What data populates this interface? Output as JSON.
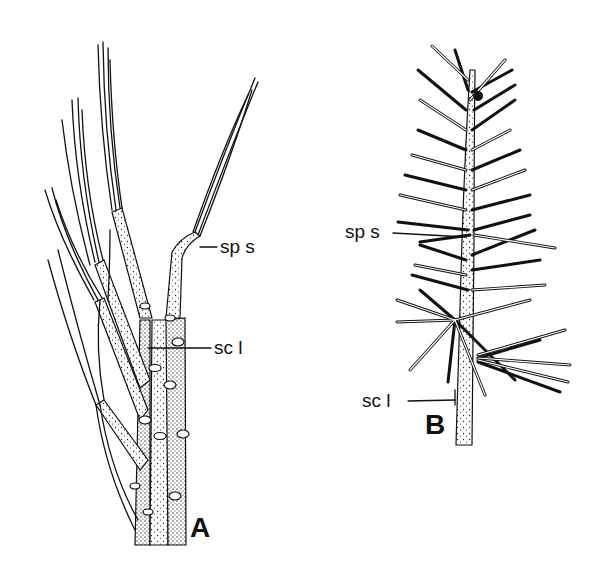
{
  "figure": {
    "panels": [
      {
        "id": "A",
        "letter": "A",
        "labels": {
          "spur_shoot": "sp s",
          "scale_leaf": "sc l"
        }
      },
      {
        "id": "B",
        "letter": "B",
        "labels": {
          "spur_shoot": "sp s",
          "scale_leaf": "sc l"
        }
      }
    ],
    "colors": {
      "ink": "#111111",
      "background": "#ffffff"
    }
  }
}
